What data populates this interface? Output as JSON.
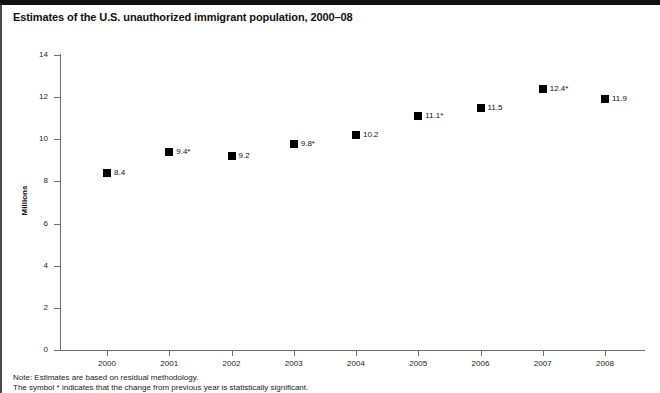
{
  "chart_data": {
    "type": "scatter",
    "title": "Estimates of the U.S. unauthorized immigrant population, 2000–08",
    "xlabel": "",
    "ylabel": "Millions",
    "categories": [
      "2000",
      "2001",
      "2002",
      "2003",
      "2004",
      "2005",
      "2006",
      "2007",
      "2008"
    ],
    "values": [
      8.4,
      9.4,
      9.2,
      9.8,
      10.2,
      11.1,
      11.5,
      12.4,
      11.9
    ],
    "point_labels": [
      "8.4",
      "9.4*",
      "9.2",
      "9.8*",
      "10.2",
      "11.1*",
      "11.5",
      "12.4*",
      "11.9"
    ],
    "significant": [
      false,
      true,
      false,
      true,
      false,
      true,
      false,
      true,
      false
    ],
    "ylim": [
      0,
      14
    ],
    "ytick_labels": [
      "0",
      "2",
      "4",
      "6",
      "8",
      "10",
      "12",
      "14"
    ],
    "yticks": [
      0,
      2,
      4,
      6,
      8,
      10,
      12,
      14
    ],
    "grid": false,
    "legend": "none",
    "marker": "filled-square",
    "marker_color": "#000000",
    "axis_color": "#6d6d6d"
  },
  "notes": [
    "Note: Estimates are based on residual methodology.",
    "The symbol * indicates that the change from previous year is statistically significant."
  ]
}
